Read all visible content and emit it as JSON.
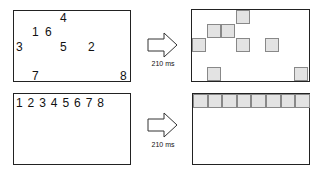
{
  "panels": {
    "top_left": {
      "numbers": [
        {
          "text": "4",
          "x": 60,
          "y": 12
        },
        {
          "text": "1",
          "x": 32,
          "y": 26
        },
        {
          "text": "6",
          "x": 45,
          "y": 26
        },
        {
          "text": "3",
          "x": 16,
          "y": 41
        },
        {
          "text": "5",
          "x": 60,
          "y": 41
        },
        {
          "text": "2",
          "x": 88,
          "y": 41
        },
        {
          "text": "7",
          "x": 32,
          "y": 70
        },
        {
          "text": "8",
          "x": 120,
          "y": 70
        }
      ]
    },
    "top_arrow": {
      "label": "210 ms"
    },
    "top_right": {
      "squares": [
        {
          "x": 236,
          "y": 10
        },
        {
          "x": 207,
          "y": 24
        },
        {
          "x": 221,
          "y": 24
        },
        {
          "x": 192,
          "y": 38
        },
        {
          "x": 236,
          "y": 38
        },
        {
          "x": 265,
          "y": 38
        },
        {
          "x": 207,
          "y": 67
        },
        {
          "x": 294,
          "y": 67
        }
      ]
    },
    "bottom_left": {
      "sequence": "1 2 3 4 5 6 7 8"
    },
    "bottom_arrow": {
      "label": "210 ms"
    },
    "bottom_right": {
      "row_cells": 8
    }
  },
  "colors": {
    "square_fill": "#e3e3e3",
    "square_border": "#888888",
    "frame": "#222222"
  }
}
